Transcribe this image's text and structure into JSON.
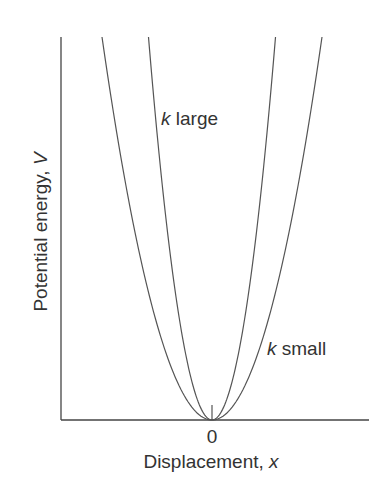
{
  "figure": {
    "y_axis_label": "Potential energy, ",
    "y_axis_var": "V",
    "x_axis_label": "Displacement, ",
    "x_axis_var": "x",
    "x_tick_label": "0",
    "curves": [
      {
        "name": "k-large",
        "k_symbol": "k",
        "label": " large"
      },
      {
        "name": "k-small",
        "k_symbol": "k",
        "label": " small"
      }
    ]
  },
  "chart_data": {
    "type": "line",
    "title": "",
    "xlabel": "Displacement, x",
    "ylabel": "Potential energy, V",
    "x_ticks": [
      "0"
    ],
    "grid": false,
    "legend": "inline annotations",
    "series": [
      {
        "name": "k large",
        "equation": "V = (1/2) k x^2",
        "relative_curvature": 3.0
      },
      {
        "name": "k small",
        "equation": "V = (1/2) k x^2",
        "relative_curvature": 1.0
      }
    ],
    "colors": {
      "line": "#555555",
      "text": "#333333"
    }
  }
}
